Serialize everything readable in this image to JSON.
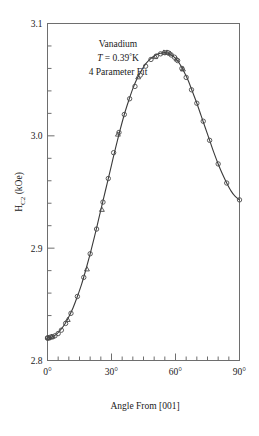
{
  "chart_data": {
    "type": "line",
    "title": "",
    "xlabel": "Angle From [001]",
    "ylabel": "H_C2 (kOe)",
    "ylabel_base": "H",
    "ylabel_sub": "C2",
    "ylabel_unit": " (kOe)",
    "xlim": [
      0,
      90
    ],
    "ylim": [
      2.8,
      3.1
    ],
    "grid": false,
    "legend": null,
    "x_major_ticks": [
      0,
      30,
      60,
      90
    ],
    "x_major_tick_labels": [
      "0°",
      "30°",
      "60°",
      "90°"
    ],
    "x_minor_tick_step": 5,
    "y_major_ticks": [
      2.8,
      2.9,
      3.0,
      3.1
    ],
    "y_major_tick_labels": [
      "2.8",
      "2.9",
      "3.0",
      "3.1"
    ],
    "y_minor_tick_step": 0.02,
    "annotations": [
      {
        "text": "Vanadium",
        "style": "normal"
      },
      {
        "text": "T = 0.39°K",
        "style": "italic-T"
      },
      {
        "text": "4 Parameter Fit",
        "style": "normal"
      }
    ],
    "annotation_line2_parts": {
      "italic": "T",
      "rest": " = 0.39",
      "degree": "°",
      "kelvin": "K"
    },
    "series": [
      {
        "name": "4 Parameter Fit",
        "kind": "fit-curve",
        "x": [
          0,
          2,
          4,
          6,
          8,
          10,
          12,
          14,
          16,
          18,
          20,
          22,
          24,
          26,
          28,
          30,
          32,
          34,
          36,
          38,
          40,
          42,
          44,
          46,
          48,
          50,
          52,
          54,
          56,
          57,
          58,
          60,
          62,
          64,
          66,
          68,
          70,
          72,
          74,
          76,
          78,
          80,
          82,
          84,
          86,
          88,
          90
        ],
        "y": [
          2.82,
          2.821,
          2.823,
          2.827,
          2.832,
          2.839,
          2.847,
          2.857,
          2.868,
          2.881,
          2.895,
          2.91,
          2.926,
          2.942,
          2.958,
          2.974,
          2.99,
          3.005,
          3.019,
          3.031,
          3.042,
          3.051,
          3.058,
          3.064,
          3.068,
          3.071,
          3.073,
          3.074,
          3.074,
          3.073,
          3.072,
          3.069,
          3.064,
          3.057,
          3.049,
          3.039,
          3.029,
          3.018,
          3.007,
          2.996,
          2.985,
          2.975,
          2.966,
          2.958,
          2.951,
          2.946,
          2.943
        ]
      },
      {
        "name": "Measured data (circles)",
        "kind": "scatter-circle",
        "x": [
          0,
          0,
          0.8,
          1.6,
          2.4,
          3.5,
          5,
          6.5,
          8.5,
          11,
          14,
          17,
          20,
          23,
          26,
          28.5,
          31,
          33.5,
          36,
          38.5,
          41,
          43.5,
          46,
          48.5,
          51,
          53,
          55,
          56.5,
          58,
          59.5,
          61,
          63,
          65,
          67.5,
          70,
          73,
          76,
          80,
          84,
          90
        ],
        "y": [
          2.82,
          2.82,
          2.82,
          2.821,
          2.821,
          2.822,
          2.824,
          2.827,
          2.833,
          2.842,
          2.857,
          2.874,
          2.895,
          2.917,
          2.941,
          2.962,
          2.985,
          3.003,
          3.019,
          3.033,
          3.044,
          3.054,
          3.062,
          3.068,
          3.071,
          3.073,
          3.074,
          3.074,
          3.072,
          3.07,
          3.067,
          3.06,
          3.052,
          3.041,
          3.029,
          3.013,
          2.996,
          2.975,
          2.958,
          2.943
        ]
      },
      {
        "name": "Measured data (triangles)",
        "kind": "scatter-triangle",
        "x": [
          0.5,
          2.0,
          9.5,
          18.5,
          25.5,
          33.0,
          42.5,
          50.5,
          54.5,
          56.0,
          57.5,
          60.5,
          63.5
        ],
        "y": [
          2.82,
          2.821,
          2.836,
          2.881,
          2.934,
          3.001,
          3.052,
          3.07,
          3.074,
          3.074,
          3.073,
          3.068,
          3.059
        ]
      }
    ]
  }
}
